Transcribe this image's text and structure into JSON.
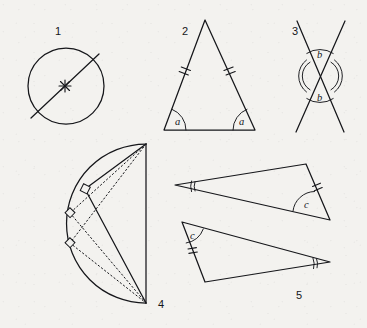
{
  "sheet": {
    "title": "Geometry figures plate",
    "background_color": "#f3f2ef",
    "ink_color": "#15161a",
    "width": 367,
    "height": 328
  },
  "figures": [
    {
      "number": "1",
      "name": "circle-with-diameter",
      "description": "Circle with a diameter drawn through a marked centre point",
      "number_label_pos": {
        "x": 55,
        "y": 35
      },
      "circle": {
        "cx": 66,
        "cy": 86,
        "r": 38
      },
      "diameter": {
        "x1": 31,
        "y1": 118,
        "x2": 99,
        "y2": 54
      },
      "centre_marker": {
        "x": 65,
        "y": 86,
        "type": "cross-star"
      }
    },
    {
      "number": "2",
      "name": "isosceles-triangle",
      "description": "Isosceles triangle with two equal sides marked by double ticks and two equal base angles labelled a",
      "number_label_pos": {
        "x": 182,
        "y": 35
      },
      "vertices": {
        "apex": {
          "x": 205,
          "y": 20
        },
        "left": {
          "x": 164,
          "y": 130
        },
        "right": {
          "x": 255,
          "y": 130
        }
      },
      "side_ticks": [
        {
          "side": "left-leg",
          "count": 2
        },
        {
          "side": "right-leg",
          "count": 2
        }
      ],
      "angle_labels": [
        {
          "text": "a",
          "x": 175,
          "y": 124,
          "vertex": "left"
        },
        {
          "text": "a",
          "x": 240,
          "y": 124,
          "vertex": "right"
        }
      ]
    },
    {
      "number": "3",
      "name": "vertical-angles",
      "description": "Two straight lines crossing, the pair of vertically opposite angles both labelled b",
      "number_label_pos": {
        "x": 292,
        "y": 35
      },
      "crossing_point": {
        "x": 320,
        "y": 76
      },
      "lines": [
        {
          "x1": 297,
          "y1": 21,
          "x2": 344,
          "y2": 132
        },
        {
          "x1": 345,
          "y1": 21,
          "x2": 296,
          "y2": 132
        }
      ],
      "angle_labels": [
        {
          "text": "b",
          "x": 317,
          "y": 57,
          "vertex": "top"
        },
        {
          "text": "b",
          "x": 317,
          "y": 100,
          "vertex": "bottom"
        }
      ]
    },
    {
      "number": "4",
      "name": "thales-semicircle",
      "description": "Semicircle on a vertical diameter with inscribed right-angled triangles; right angles marked with small squares on the arc",
      "number_label_pos": {
        "x": 158,
        "y": 308
      },
      "diameter": {
        "x1": 146,
        "y1": 144,
        "x2": 146,
        "y2": 303
      },
      "arc_radius": 79.5,
      "right_angle_markers": [
        {
          "x": 81,
          "y": 186
        },
        {
          "x": 68,
          "y": 211
        },
        {
          "x": 68,
          "y": 240
        }
      ],
      "solid_chords": [
        {
          "from": "top-end",
          "to": "vertex-1"
        },
        {
          "from": "vertex-1",
          "to": "bottom-end"
        }
      ],
      "dashed_chords": [
        {
          "from": "top-end",
          "to": "vertex-2"
        },
        {
          "from": "vertex-2",
          "to": "bottom-end"
        },
        {
          "from": "top-end",
          "to": "vertex-3"
        },
        {
          "from": "vertex-3",
          "to": "bottom-end"
        }
      ]
    },
    {
      "number": "5",
      "name": "congruent-triangles",
      "description": "Two congruent thin triangles in different orientations, matching parts marked with angle c, a double-arc angle and a double tick side",
      "number_label_pos": {
        "x": 296,
        "y": 299
      },
      "upper_triangle": {
        "vertices": [
          {
            "x": 175,
            "y": 185
          },
          {
            "x": 306,
            "y": 164
          },
          {
            "x": 330,
            "y": 220
          }
        ],
        "angle_label": {
          "text": "c",
          "x": 307,
          "y": 205
        },
        "double_arc_vertex": {
          "x": 175,
          "y": 185
        },
        "tick_side": {
          "count": 2,
          "between": [
            "v1",
            "v2"
          ]
        }
      },
      "lower_triangle": {
        "vertices": [
          {
            "x": 182,
            "y": 222
          },
          {
            "x": 330,
            "y": 262
          },
          {
            "x": 205,
            "y": 282
          }
        ],
        "angle_label": {
          "text": "c",
          "x": 194,
          "y": 236
        },
        "double_arc_vertex": {
          "x": 330,
          "y": 262
        },
        "tick_side": {
          "count": 2,
          "between": [
            "v1",
            "v3"
          ]
        }
      }
    }
  ]
}
